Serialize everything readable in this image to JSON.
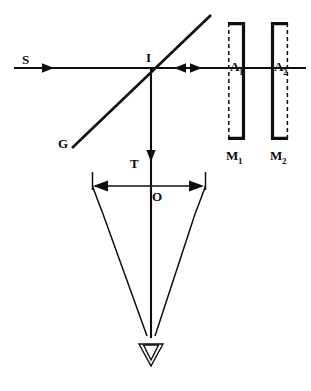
{
  "figure": {
    "kind": "optical-interferometer-diagram",
    "title": "",
    "background_color": "#ffffff",
    "ink_color": "#0f0f0f"
  },
  "labels": {
    "source": {
      "text": "S",
      "x": 22,
      "y": 64
    },
    "beam_splitter": {
      "text": "G",
      "x": 58,
      "y": 148
    },
    "intersection": {
      "text": "I",
      "x": 146,
      "y": 62
    },
    "aperture_1": {
      "base": "A",
      "sub": "1",
      "x": 240,
      "y": 71
    },
    "aperture_2": {
      "base": "A",
      "sub": "2",
      "x": 285,
      "y": 71
    },
    "mirror_1": {
      "base": "M",
      "sub": "1",
      "x": 232,
      "y": 160
    },
    "mirror_2": {
      "base": "M",
      "sub": "2",
      "x": 277,
      "y": 160
    },
    "transmitted": {
      "text": "T",
      "x": 130,
      "y": 168
    },
    "observation": {
      "text": "O",
      "x": 152,
      "y": 201
    }
  },
  "elements": {
    "incident_ray": {
      "name": "incident-beam-from-source",
      "from_x": 14,
      "from_y": 68,
      "to_x": 306,
      "to_y": 68,
      "arrow_x": 48,
      "arrow_dir": "right"
    },
    "return_arrow_left": {
      "x": 176,
      "y": 68,
      "dir": "left"
    },
    "return_arrow_right": {
      "x": 196,
      "y": 68,
      "dir": "right"
    },
    "splitter_line": {
      "name": "beam-splitter-G",
      "from_x": 72,
      "from_y": 148,
      "to_x": 211,
      "to_y": 15
    },
    "vertical_ray": {
      "name": "transmitted-beam-T",
      "from_x": 151,
      "from_y": 68,
      "to_x": 151,
      "to_y": 340,
      "arrow_y": 160,
      "arrow_dir": "down"
    },
    "mirror_1_body": {
      "name": "mirror-M1",
      "x": 228,
      "y": 22,
      "width": 16,
      "height": 118,
      "solid_side": "right"
    },
    "mirror_2_body": {
      "name": "mirror-M2",
      "x": 272,
      "y": 22,
      "width": 16,
      "height": 118,
      "solid_side": "left"
    },
    "cone": {
      "name": "convergence-cone",
      "left_top_x": 92,
      "right_top_x": 205,
      "top_y": 172,
      "apex_x": 151,
      "apex_y": 340
    },
    "width_arrow": {
      "name": "aperture-width-double-arrow",
      "from_x": 95,
      "to_x": 201,
      "y": 186
    },
    "eye": {
      "name": "observer-eye-symbol",
      "x": 151,
      "y": 352
    }
  },
  "icon_names": [
    "arrow-right-icon",
    "arrow-left-icon",
    "arrow-down-icon",
    "double-arrow-horizontal-icon",
    "eye-triangle-icon",
    "mirror-icon",
    "beam-splitter-icon"
  ]
}
